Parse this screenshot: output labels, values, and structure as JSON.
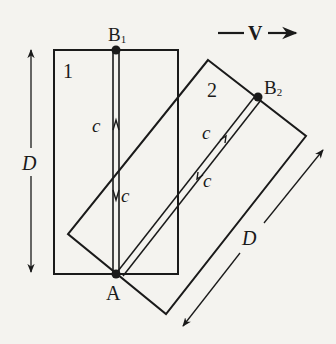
{
  "diagram": {
    "colors": {
      "background": "#f4f3ef",
      "ink": "#1a1a1a"
    },
    "velocity": {
      "label": "V",
      "prefix": "—",
      "direction": "right"
    },
    "frame1": {
      "label": "1",
      "point_top": "B",
      "point_top_sub": "1",
      "point_bottom": "A"
    },
    "frame2": {
      "label": "2",
      "point_top": "B",
      "point_top_sub": "2"
    },
    "light_speed_label": "c",
    "length_label": "D",
    "light_labels": {
      "frame1_up": "c",
      "frame1_down": "c",
      "frame2_up": "c",
      "frame2_down": "c"
    },
    "dimension_labels": {
      "frame1_height": "D",
      "frame2_length": "D"
    }
  }
}
